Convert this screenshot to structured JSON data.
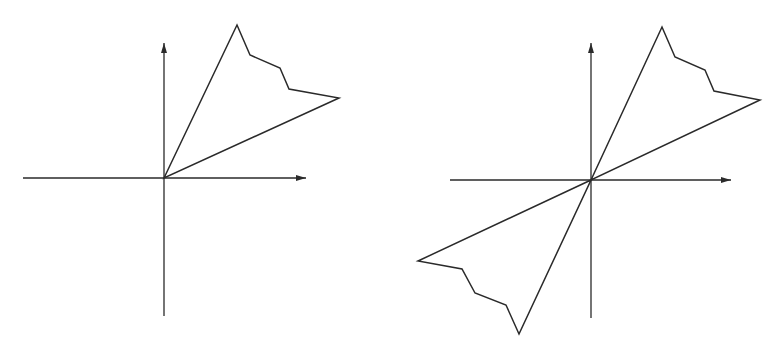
{
  "diagram": {
    "colors": {
      "stroke": "#2a2a2a",
      "background": "#ffffff"
    },
    "panels": [
      {
        "id": "left",
        "origin": [
          164,
          178
        ],
        "x_axis": {
          "from": [
            23,
            178
          ],
          "to": [
            306,
            178
          ],
          "arrow": "right"
        },
        "y_axis": {
          "from": [
            164,
            316
          ],
          "to": [
            164,
            43
          ],
          "arrow": "up"
        },
        "polygons": [
          {
            "name": "first-quadrant-region",
            "points": [
              [
                164,
                178
              ],
              [
                237,
                25
              ],
              [
                250,
                55
              ],
              [
                280,
                68
              ],
              [
                289,
                89
              ],
              [
                339,
                98
              ]
            ]
          }
        ]
      },
      {
        "id": "right",
        "origin": [
          591,
          180
        ],
        "x_axis": {
          "from": [
            450,
            180
          ],
          "to": [
            731,
            180
          ],
          "arrow": "right"
        },
        "y_axis": {
          "from": [
            591,
            318
          ],
          "to": [
            591,
            43
          ],
          "arrow": "up"
        },
        "polygons": [
          {
            "name": "first-quadrant-region",
            "points": [
              [
                591,
                180
              ],
              [
                662,
                27
              ],
              [
                675,
                57
              ],
              [
                705,
                70
              ],
              [
                714,
                91
              ],
              [
                760,
                100
              ]
            ]
          },
          {
            "name": "third-quadrant-reflected-region",
            "points": [
              [
                591,
                180
              ],
              [
                418,
                261
              ],
              [
                462,
                269
              ],
              [
                475,
                293
              ],
              [
                506,
                305
              ],
              [
                519,
                334
              ]
            ]
          }
        ]
      }
    ]
  }
}
